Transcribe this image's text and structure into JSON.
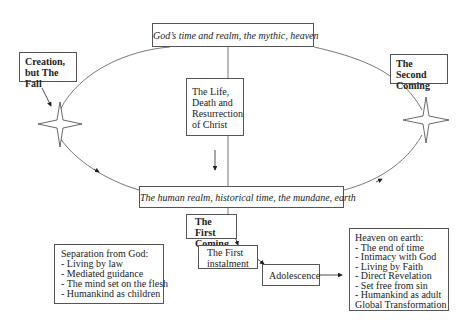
{
  "diagram": {
    "heaven_realm_label": "God’s time and realm, the mythic, heaven",
    "human_realm_label": "The human realm, historical time, the mundane, earth",
    "christ_box": {
      "lines": [
        "The Life,",
        "Death and",
        "Resurrection",
        "of Christ"
      ]
    },
    "creation_box": {
      "lines": [
        "Creation,",
        "but The Fall"
      ]
    },
    "second_coming_box": {
      "lines": [
        "The Second",
        "Coming"
      ]
    },
    "first_coming_box": {
      "lines": [
        "The First",
        "Coming"
      ]
    },
    "first_instalment_box": {
      "lines": [
        "The First",
        "instalment"
      ]
    },
    "adolescence_box": {
      "label": "Adolescence"
    },
    "separation_box": {
      "title": "Separation from God:",
      "items": [
        "- Living by law",
        "- Mediated guidance",
        "- The mind set on the flesh",
        "- Humankind as children"
      ]
    },
    "heaven_on_earth_box": {
      "title": "Heaven on earth:",
      "items": [
        "- The end of time",
        "- Intimacy with  God",
        "- Living by Faith",
        "- Direct Revelation",
        "- Set free from sin",
        "- Humankind as adult"
      ],
      "footer": "Global Transformation"
    },
    "icons": {
      "left_star": "four-point-star",
      "right_star": "four-point-star"
    },
    "colors": {
      "line": "#555555",
      "text": "#222222",
      "background": "#ffffff"
    }
  }
}
